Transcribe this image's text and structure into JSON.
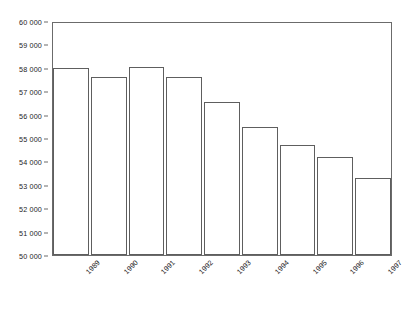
{
  "chart_data": {
    "type": "bar",
    "title": "",
    "subtitle": "",
    "xlabel": "",
    "ylabel": "",
    "categories": [
      "1989",
      "1990",
      "1991",
      "1992",
      "1993",
      "1994",
      "1995",
      "1996",
      "1997"
    ],
    "values": [
      58000,
      57600,
      58050,
      57600,
      56550,
      55450,
      54700,
      54200,
      53300
    ],
    "ylim": [
      50000,
      60000
    ],
    "y_tick_step": 1000,
    "y_tick_labels": [
      "60 000",
      "59 000",
      "58 000",
      "57 000",
      "56 000",
      "55 000",
      "54 000",
      "53 000",
      "52 000",
      "51 000",
      "50 000"
    ],
    "y_tick_values": [
      60000,
      59000,
      58000,
      57000,
      56000,
      55000,
      54000,
      53000,
      52000,
      51000,
      50000
    ],
    "grid": false,
    "legend": false,
    "legend_position": "none",
    "x_label_rotation_deg": -45,
    "colors": {
      "bar_fill": "#ffffff",
      "bar_outline": "#5e5e5e",
      "frame": "#6b6b6b",
      "text": "#1c1c1c",
      "background": "#ffffff"
    }
  }
}
